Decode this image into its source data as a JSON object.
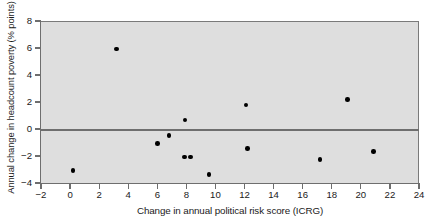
{
  "chart_data": {
    "type": "scatter",
    "title": "",
    "xlabel": "Change in annual political risk score (ICRG)",
    "ylabel": "Annual change in headcount poverty (% points)",
    "xlim": [
      -2,
      24
    ],
    "ylim": [
      -4,
      8
    ],
    "xticks": [
      -2,
      0,
      2,
      4,
      6,
      8,
      10,
      12,
      14,
      16,
      18,
      20,
      22,
      24
    ],
    "xtick_labels": [
      "−2",
      "0",
      "2",
      "4",
      "6",
      "8",
      "10",
      "12",
      "14",
      "16",
      "18",
      "20",
      "22",
      "24"
    ],
    "yticks": [
      -4,
      -2,
      0,
      2,
      4,
      6,
      8
    ],
    "ytick_labels": [
      "−4",
      "−2",
      "0",
      "2",
      "4",
      "6",
      "8"
    ],
    "grid": false,
    "legend": null,
    "zero_line": 0,
    "plot_background": "#dedede",
    "marker_color": "#000000",
    "axis_color": "#6e6e6e",
    "points": [
      {
        "x": 0.2,
        "y": -3.0
      },
      {
        "x": 3.2,
        "y": 6.0
      },
      {
        "x": 6.0,
        "y": -1.0
      },
      {
        "x": 6.8,
        "y": -0.4
      },
      {
        "x": 7.9,
        "y": 0.75
      },
      {
        "x": 7.85,
        "y": -2.0
      },
      {
        "x": 8.3,
        "y": -2.0
      },
      {
        "x": 9.55,
        "y": -3.3
      },
      {
        "x": 12.1,
        "y": 1.85
      },
      {
        "x": 12.2,
        "y": -1.35
      },
      {
        "x": 17.2,
        "y": -2.2
      },
      {
        "x": 19.1,
        "y": 2.25
      },
      {
        "x": 20.85,
        "y": -1.6
      }
    ]
  }
}
